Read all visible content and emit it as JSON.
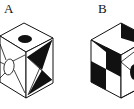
{
  "figure": {
    "options": [
      {
        "label": "A",
        "description": "Cube with black ellipse on top face, two black triangles on right face, white ellipse with spokes on left face"
      },
      {
        "label": "B",
        "description": "Cube with black triangle on top face, checkerboard pattern on left face, diagonal line and black ellipse on right face"
      }
    ],
    "colors": {
      "ink": "#111111",
      "paper": "#ffffff"
    }
  }
}
